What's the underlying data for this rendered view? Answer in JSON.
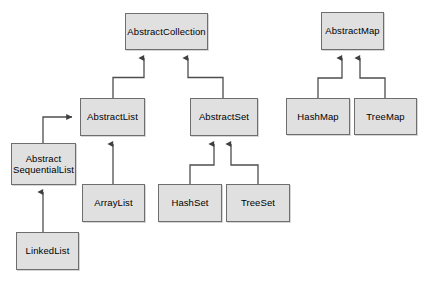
{
  "diagram": {
    "type": "uml-class-hierarchy",
    "background_color": "#ffffff",
    "node_fill_color": "#e0e0e0",
    "node_border_color": "#6e6e6e",
    "edge_color": "#4d4d4d",
    "text_color": "#000000",
    "nodes": [
      {
        "id": "abstract-collection",
        "label": "AbstractCollection",
        "x": 125,
        "y": 13,
        "w": 83,
        "h": 37
      },
      {
        "id": "abstract-map",
        "label": "AbstractMap",
        "x": 321,
        "y": 12,
        "w": 63,
        "h": 38
      },
      {
        "id": "abstract-list",
        "label": "AbstractList",
        "x": 80,
        "y": 98,
        "w": 65,
        "h": 38
      },
      {
        "id": "abstract-set",
        "label": "AbstractSet",
        "x": 190,
        "y": 98,
        "w": 68,
        "h": 38
      },
      {
        "id": "hash-map",
        "label": "HashMap",
        "x": 286,
        "y": 98,
        "w": 64,
        "h": 37
      },
      {
        "id": "tree-map",
        "label": "TreeMap",
        "x": 354,
        "y": 98,
        "w": 63,
        "h": 37
      },
      {
        "id": "abstract-sequential-list",
        "label": "Abstract\nSequentialList",
        "x": 11,
        "y": 143,
        "w": 65,
        "h": 42
      },
      {
        "id": "array-list",
        "label": "ArrayList",
        "x": 82,
        "y": 184,
        "w": 63,
        "h": 38
      },
      {
        "id": "hash-set",
        "label": "HashSet",
        "x": 158,
        "y": 184,
        "w": 64,
        "h": 38
      },
      {
        "id": "tree-set",
        "label": "TreeSet",
        "x": 226,
        "y": 184,
        "w": 64,
        "h": 38
      },
      {
        "id": "linked-list",
        "label": "LinkedList",
        "x": 16,
        "y": 232,
        "w": 63,
        "h": 38
      }
    ],
    "edges": [
      {
        "id": "abstract-list-to-abstract-collection",
        "from": "AbstractList",
        "to": "AbstractCollection",
        "relation": "extends"
      },
      {
        "id": "abstract-set-to-abstract-collection",
        "from": "AbstractSet",
        "to": "AbstractCollection",
        "relation": "extends"
      },
      {
        "id": "hash-map-to-abstract-map",
        "from": "HashMap",
        "to": "AbstractMap",
        "relation": "extends"
      },
      {
        "id": "tree-map-to-abstract-map",
        "from": "TreeMap",
        "to": "AbstractMap",
        "relation": "extends"
      },
      {
        "id": "abstract-sequential-list-to-abstract-list",
        "from": "AbstractSequentialList",
        "to": "AbstractList",
        "relation": "extends"
      },
      {
        "id": "array-list-to-abstract-list",
        "from": "ArrayList",
        "to": "AbstractList",
        "relation": "extends"
      },
      {
        "id": "hash-set-to-abstract-set",
        "from": "HashSet",
        "to": "AbstractSet",
        "relation": "extends"
      },
      {
        "id": "tree-set-to-abstract-set",
        "from": "TreeSet",
        "to": "AbstractSet",
        "relation": "extends"
      },
      {
        "id": "linked-list-to-abstract-sequential-list",
        "from": "LinkedList",
        "to": "AbstractSequentialList",
        "relation": "extends"
      }
    ]
  }
}
